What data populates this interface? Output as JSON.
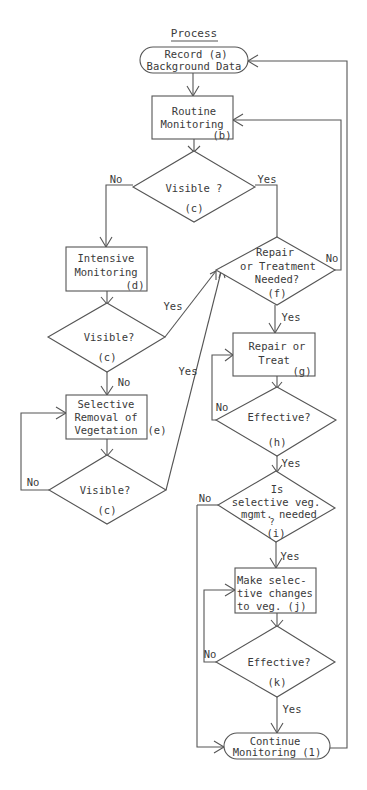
{
  "diagram": {
    "title": "Process",
    "nodes": {
      "a": {
        "lines": [
          "Record    (a)",
          "Background Data"
        ],
        "shape": "terminal"
      },
      "b": {
        "lines": [
          "Routine",
          "Monitoring"
        ],
        "tag": "(b)",
        "shape": "process"
      },
      "c1": {
        "lines": [
          "Visible ?"
        ],
        "tag": "(c)",
        "shape": "decision"
      },
      "d": {
        "lines": [
          "Intensive",
          "Monitoring"
        ],
        "tag": "(d)",
        "shape": "process"
      },
      "c2": {
        "lines": [
          "Visible?"
        ],
        "tag": "(c)",
        "shape": "decision"
      },
      "e": {
        "lines": [
          "Selective",
          "Removal of",
          "Vegetation"
        ],
        "tag": "(e)",
        "shape": "process"
      },
      "c3": {
        "lines": [
          "Visible?"
        ],
        "tag": "(c)",
        "shape": "decision"
      },
      "f": {
        "lines": [
          "Repair",
          "or Treatment",
          "Needed?"
        ],
        "tag": "(f)",
        "shape": "decision"
      },
      "g": {
        "lines": [
          "Repair or",
          "Treat"
        ],
        "tag": "(g)",
        "shape": "process"
      },
      "h": {
        "lines": [
          "Effective?"
        ],
        "tag": "(h)",
        "shape": "decision"
      },
      "i": {
        "lines": [
          "Is",
          "selective veg.",
          "mgmt. needed"
        ],
        "qmark": "?",
        "tag": "(i)",
        "shape": "decision"
      },
      "j": {
        "lines": [
          "Make selec-",
          "tive changes",
          "to veg.   (j)"
        ],
        "shape": "process"
      },
      "k": {
        "lines": [
          "Effective?"
        ],
        "tag": "(k)",
        "shape": "decision"
      },
      "l": {
        "lines": [
          "Continue",
          "Monitoring (1)"
        ],
        "shape": "terminal"
      }
    },
    "edge_labels": {
      "c1_no": "No",
      "c1_yes": "Yes",
      "c2_yes": "Yes",
      "c2_no": "No",
      "c3_yes": "Yes",
      "c3_no": "No",
      "f_no": "No",
      "f_yes": "Yes",
      "h_no": "No",
      "h_yes": "Yes",
      "i_no": "No",
      "i_yes": "Yes",
      "k_no": "No",
      "k_yes": "Yes"
    },
    "edges": [
      {
        "from": "a",
        "to": "b"
      },
      {
        "from": "b",
        "to": "c1"
      },
      {
        "from": "c1",
        "to": "d",
        "label": "No"
      },
      {
        "from": "c1",
        "to": "f",
        "label": "Yes"
      },
      {
        "from": "d",
        "to": "c2"
      },
      {
        "from": "c2",
        "to": "f",
        "label": "Yes"
      },
      {
        "from": "c2",
        "to": "e",
        "label": "No"
      },
      {
        "from": "e",
        "to": "c3"
      },
      {
        "from": "c3",
        "to": "f",
        "label": "Yes"
      },
      {
        "from": "c3",
        "to": "e",
        "label": "No"
      },
      {
        "from": "f",
        "to": "b",
        "label": "No"
      },
      {
        "from": "f",
        "to": "g",
        "label": "Yes"
      },
      {
        "from": "g",
        "to": "h"
      },
      {
        "from": "h",
        "to": "g",
        "label": "No"
      },
      {
        "from": "h",
        "to": "i",
        "label": "Yes"
      },
      {
        "from": "i",
        "to": "j",
        "label": "Yes"
      },
      {
        "from": "i",
        "to": "l",
        "label": "No"
      },
      {
        "from": "j",
        "to": "k"
      },
      {
        "from": "k",
        "to": "j",
        "label": "No"
      },
      {
        "from": "k",
        "to": "l",
        "label": "Yes"
      },
      {
        "from": "l",
        "to": "a"
      }
    ]
  }
}
